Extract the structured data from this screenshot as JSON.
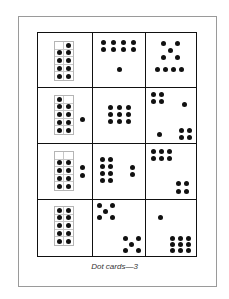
{
  "caption": "Dot cards—3",
  "colors": {
    "dot": "#111111",
    "grid_border": "#111111",
    "ten_frame_border": "#b5b5b5",
    "page_border": "#9a9a9a"
  },
  "cards": [
    {
      "row": 1,
      "col": 1,
      "type": "ten-frame",
      "filled": [
        false,
        true,
        true,
        true,
        true,
        true,
        true,
        true,
        true,
        true
      ],
      "extra_dots": 0,
      "total": 9
    },
    {
      "row": 1,
      "col": 2,
      "type": "dot-pattern",
      "groups": [
        "2x4 array (8)",
        "single dot (1)"
      ],
      "total": 9
    },
    {
      "row": 1,
      "col": 3,
      "type": "dot-pattern",
      "groups": [
        "dice five (5)",
        "row of four (4)"
      ],
      "total": 9
    },
    {
      "row": 2,
      "col": 1,
      "type": "ten-frame",
      "filled": [
        true,
        false,
        true,
        true,
        true,
        true,
        true,
        true,
        true,
        true
      ],
      "extra_dots": 1,
      "total": 10
    },
    {
      "row": 2,
      "col": 2,
      "type": "dot-pattern",
      "groups": [
        "3x3 array (9)"
      ],
      "total": 9
    },
    {
      "row": 2,
      "col": 3,
      "type": "dot-pattern",
      "groups": [
        "2x2 (4)",
        "single (1)",
        "single (1)",
        "2x2 (4)"
      ],
      "total": 10
    },
    {
      "row": 3,
      "col": 1,
      "type": "ten-frame",
      "filled": [
        false,
        false,
        true,
        true,
        true,
        true,
        true,
        true,
        true,
        true
      ],
      "extra_dots": 2,
      "total": 10
    },
    {
      "row": 3,
      "col": 2,
      "type": "dot-pattern",
      "groups": [
        "2x4 array (8)",
        "pair (2)"
      ],
      "total": 10
    },
    {
      "row": 3,
      "col": 3,
      "type": "dot-pattern",
      "groups": [
        "2x3 array (6)",
        "2x2 (4)"
      ],
      "total": 10
    },
    {
      "row": 4,
      "col": 1,
      "type": "ten-frame",
      "filled": [
        true,
        true,
        true,
        true,
        true,
        true,
        true,
        true,
        true,
        true
      ],
      "extra_dots": 0,
      "total": 10
    },
    {
      "row": 4,
      "col": 2,
      "type": "dot-pattern",
      "groups": [
        "dice five (5)",
        "dice five (5)"
      ],
      "total": 10
    },
    {
      "row": 4,
      "col": 3,
      "type": "dot-pattern",
      "groups": [
        "single (1)",
        "3x3 array (9)"
      ],
      "total": 10
    }
  ]
}
